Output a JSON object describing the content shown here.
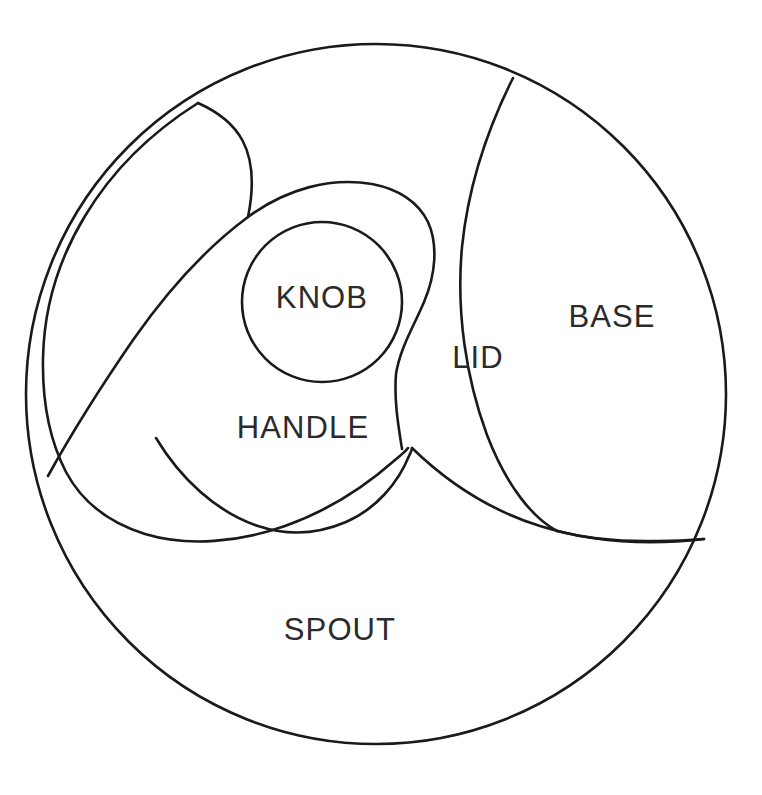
{
  "diagram": {
    "canvas": {
      "width": 762,
      "height": 795,
      "background": "#ffffff"
    },
    "stroke_color": "#1a1a1a",
    "label_color": "#2b2b2b",
    "hatch_color": "#1a1a1a",
    "outer_circle": {
      "cx": 376,
      "cy": 394,
      "r": 350
    },
    "knob_circle": {
      "cx": 322,
      "cy": 302,
      "r": 80
    },
    "regions": [
      {
        "id": "knob",
        "label": "KNOB",
        "label_x": 322,
        "label_y": 300,
        "hatched": false
      },
      {
        "id": "handle",
        "label": "HANDLE",
        "label_x": 303,
        "label_y": 430,
        "hatched": false
      },
      {
        "id": "lid",
        "label": "LID",
        "label_x": 478,
        "label_y": 360,
        "hatched": false
      },
      {
        "id": "base",
        "label": "BASE",
        "label_x": 612,
        "label_y": 319,
        "hatched": false
      },
      {
        "id": "spout",
        "label": "SPOUT",
        "label_x": 340,
        "label_y": 632,
        "hatched": false
      }
    ],
    "hatched_areas": [
      {
        "id": "hatch-outer-lune",
        "note": "large crescent at upper-left"
      },
      {
        "id": "hatch-inner-lune",
        "note": "crescent above knob"
      },
      {
        "id": "hatch-lid-sliver",
        "note": "narrow sliver left of lid"
      }
    ]
  }
}
